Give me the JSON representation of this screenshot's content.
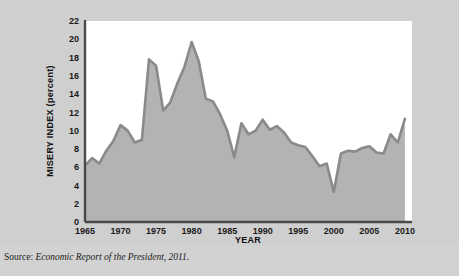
{
  "figure": {
    "source_label": "Source:",
    "source_title": "Economic Report of the President, 2011.",
    "plot_bg": "#ffffff",
    "fill_color": "#b3b3b3",
    "line_color": "#8a8a8a",
    "grid_color": "#ffffff",
    "axis_color": "#4a4a4a",
    "page_bg": "#cfcfcf"
  },
  "chart_data": {
    "type": "area",
    "title": "",
    "subtitle": "",
    "xlabel": "YEAR",
    "ylabel": "MISERY INDEX (percent)",
    "xlim": [
      1965,
      2011
    ],
    "ylim": [
      0,
      22
    ],
    "xticks": [
      1965,
      1970,
      1975,
      1980,
      1985,
      1990,
      1995,
      2000,
      2005,
      2010
    ],
    "yticks": [
      0,
      2,
      4,
      6,
      8,
      10,
      12,
      14,
      16,
      18,
      20,
      22
    ],
    "xtick_labels": [
      "1965",
      "1970",
      "1975",
      "1980",
      "1985",
      "1990",
      "1995",
      "2000",
      "2005",
      "2010"
    ],
    "ytick_labels": [
      "0",
      "2",
      "4",
      "6",
      "8",
      "10",
      "12",
      "14",
      "16",
      "18",
      "20",
      "22"
    ],
    "grid": true,
    "grid_axis": "both",
    "legend": false,
    "legend_position": "none",
    "series": [
      {
        "name": "Misery Index",
        "x": [
          1965,
          1966,
          1967,
          1968,
          1969,
          1970,
          1971,
          1972,
          1973,
          1974,
          1975,
          1976,
          1977,
          1978,
          1979,
          1980,
          1981,
          1982,
          1983,
          1984,
          1985,
          1986,
          1987,
          1988,
          1989,
          1990,
          1991,
          1992,
          1993,
          1994,
          1995,
          1996,
          1997,
          1998,
          1999,
          2000,
          2001,
          2002,
          2003,
          2004,
          2005,
          2006,
          2007,
          2008,
          2009,
          2010
        ],
        "values": [
          6.2,
          7.0,
          6.4,
          7.8,
          8.9,
          10.6,
          10.0,
          8.7,
          9.0,
          17.8,
          17.1,
          12.2,
          13.1,
          15.2,
          17.0,
          19.7,
          17.6,
          13.5,
          13.2,
          11.8,
          10.0,
          7.1,
          10.8,
          9.6,
          10.0,
          11.2,
          10.1,
          10.5,
          9.8,
          8.7,
          8.4,
          8.2,
          7.2,
          6.1,
          6.4,
          3.3,
          7.5,
          7.8,
          7.7,
          8.1,
          8.3,
          7.6,
          7.5,
          9.6,
          8.7,
          11.3
        ]
      }
    ],
    "annotations": [],
    "notes": [
      "Misery Index = inflation rate + unemployment rate",
      "Peaks near 17.8 (1974) and 19.7 (1980); trough near 3.3 (2000)"
    ]
  }
}
